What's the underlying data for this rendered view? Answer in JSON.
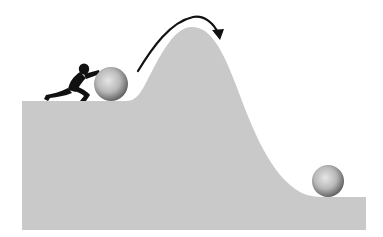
{
  "illustration": {
    "title": "Person pushing a ball up a hill; ball rolls down the other side",
    "colors": {
      "background": "#ffffff",
      "terrain": "#c9c9c9",
      "figure": "#111111",
      "arrow": "#111111",
      "ball_light": "#e4e4e4",
      "ball_dark": "#6a6a6a"
    },
    "elements": [
      "terrain-hill",
      "person-pushing",
      "ball-uphill",
      "ball-downhill",
      "arc-arrow"
    ]
  }
}
